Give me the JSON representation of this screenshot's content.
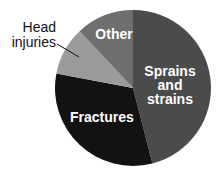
{
  "chart_data": {
    "type": "pie",
    "title": "",
    "categories": [
      "Sprains and strains",
      "Fractures",
      "Head injuries",
      "Other"
    ],
    "values": [
      46,
      32,
      10,
      12
    ],
    "colors": [
      "#4b4b4b",
      "#121212",
      "#9b9b9b",
      "#6f6f6f"
    ],
    "start_angle_deg_clockwise_from_top": 0,
    "legend": "none (direct labels)"
  },
  "labels": {
    "sprains": "Sprains\nand strains",
    "sprains_line1": "Sprains",
    "sprains_line2": "and strains",
    "fractures": "Fractures",
    "head_line1": "Head",
    "head_line2": "injuries",
    "other": "Other"
  }
}
